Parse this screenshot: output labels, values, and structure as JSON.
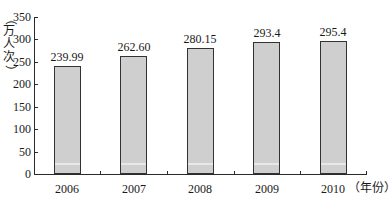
{
  "chart_data": {
    "type": "bar",
    "title": "",
    "categories": [
      "2006",
      "2007",
      "2008",
      "2009",
      "2010"
    ],
    "values": [
      239.99,
      262.6,
      280.15,
      293.4,
      295.4
    ],
    "value_labels": [
      "239.99",
      "262.60",
      "280.15",
      "293.4",
      "295.4"
    ],
    "xlabel": "（年份）",
    "ylabel": "（万人次）",
    "ylim": [
      0,
      350
    ],
    "yticks": [
      "0",
      "50",
      "100",
      "150",
      "200",
      "250",
      "300",
      "350"
    ],
    "grid": false,
    "legend": null,
    "bar_color": "#cfcfcf",
    "bar_border": "#333333"
  }
}
